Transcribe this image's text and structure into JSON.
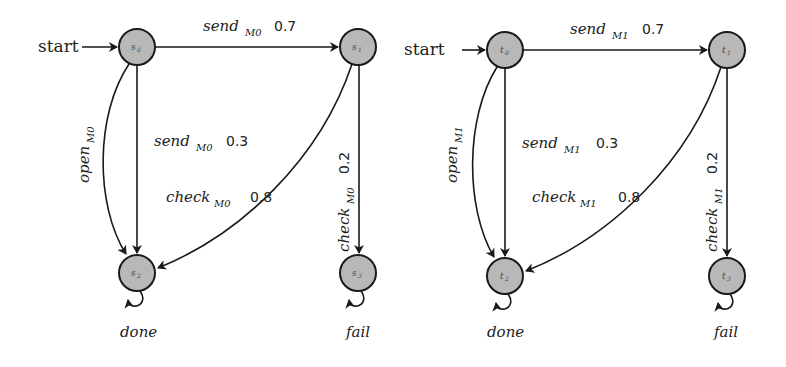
{
  "diagram": {
    "type": "markov-decision-process-pair",
    "start_label": "start",
    "machines": [
      {
        "id": "M0",
        "nodes": [
          {
            "id": "s0",
            "label": "s",
            "sub": "0",
            "initial": true
          },
          {
            "id": "s1",
            "label": "s",
            "sub": "1"
          },
          {
            "id": "s2",
            "label": "s",
            "sub": "2"
          },
          {
            "id": "s3",
            "label": "s",
            "sub": "3"
          }
        ],
        "edges": [
          {
            "from": "s0",
            "to": "s1",
            "action": "send",
            "sub": "M0",
            "prob": "0.7"
          },
          {
            "from": "s0",
            "to": "s2",
            "action": "send",
            "sub": "M0",
            "prob": "0.3"
          },
          {
            "from": "s0",
            "to": "s2",
            "action": "open",
            "sub": "M0",
            "prob": ""
          },
          {
            "from": "s1",
            "to": "s2",
            "action": "check",
            "sub": "M0",
            "prob": "0.8"
          },
          {
            "from": "s1",
            "to": "s3",
            "action": "check",
            "sub": "M0",
            "prob": "0.2"
          },
          {
            "from": "s2",
            "to": "s2",
            "action": "done",
            "sub": "",
            "prob": ""
          },
          {
            "from": "s3",
            "to": "s3",
            "action": "fail",
            "sub": "",
            "prob": ""
          }
        ]
      },
      {
        "id": "M1",
        "nodes": [
          {
            "id": "t0",
            "label": "t",
            "sub": "0",
            "initial": true
          },
          {
            "id": "t1",
            "label": "t",
            "sub": "1"
          },
          {
            "id": "t2",
            "label": "t",
            "sub": "2"
          },
          {
            "id": "t3",
            "label": "t",
            "sub": "3"
          }
        ],
        "edges": [
          {
            "from": "t0",
            "to": "t1",
            "action": "send",
            "sub": "M1",
            "prob": "0.7"
          },
          {
            "from": "t0",
            "to": "t2",
            "action": "send",
            "sub": "M1",
            "prob": "0.3"
          },
          {
            "from": "t0",
            "to": "t2",
            "action": "open",
            "sub": "M1",
            "prob": ""
          },
          {
            "from": "t1",
            "to": "t2",
            "action": "check",
            "sub": "M1",
            "prob": "0.8"
          },
          {
            "from": "t1",
            "to": "t3",
            "action": "check",
            "sub": "M1",
            "prob": "0.2"
          },
          {
            "from": "t2",
            "to": "t2",
            "action": "done",
            "sub": "",
            "prob": ""
          },
          {
            "from": "t3",
            "to": "t3",
            "action": "fail",
            "sub": "",
            "prob": ""
          }
        ]
      }
    ]
  },
  "colors": {
    "node_fill": "#b8b8b8",
    "stroke": "#1a1a1a",
    "background": "#ffffff"
  }
}
